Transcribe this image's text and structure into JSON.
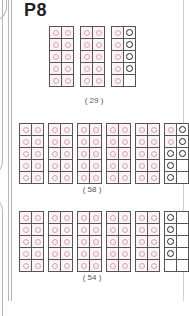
{
  "page": {
    "label": "P8"
  },
  "colors": {
    "pink_dot": "#d9a2b6",
    "pink_fill": "#fbf3f6",
    "black_dot": "#222222",
    "grid_border": "#555555"
  },
  "problems": [
    {
      "answer": "( 29 )",
      "value": 29,
      "blocks": [
        {
          "left": [
            "pink",
            "pink",
            "pink",
            "pink",
            "pink"
          ],
          "right": [
            "pink",
            "pink",
            "pink",
            "pink",
            "pink"
          ]
        },
        {
          "left": [
            "pink",
            "pink",
            "pink",
            "pink",
            "pink"
          ],
          "right": [
            "pink",
            "pink",
            "pink",
            "pink",
            "pink"
          ]
        },
        {
          "left": [
            "pink",
            "pink",
            "pink",
            "pink",
            "pink"
          ],
          "right": [
            "black",
            "black",
            "black",
            "black",
            "empty"
          ]
        }
      ]
    },
    {
      "answer": "( 58 )",
      "value": 58,
      "blocks": [
        {
          "left": [
            "pink",
            "pink",
            "pink",
            "pink",
            "pink"
          ],
          "right": [
            "pink",
            "pink",
            "pink",
            "pink",
            "pink"
          ]
        },
        {
          "left": [
            "pink",
            "pink",
            "pink",
            "pink",
            "pink"
          ],
          "right": [
            "pink",
            "pink",
            "pink",
            "pink",
            "pink"
          ]
        },
        {
          "left": [
            "pink",
            "pink",
            "pink",
            "pink",
            "pink"
          ],
          "right": [
            "pink",
            "pink",
            "pink",
            "pink",
            "pink"
          ]
        },
        {
          "left": [
            "pink",
            "pink",
            "pink",
            "pink",
            "pink"
          ],
          "right": [
            "pink",
            "pink",
            "pink",
            "pink",
            "pink"
          ]
        },
        {
          "left": [
            "pink",
            "pink",
            "pink",
            "pink",
            "pink"
          ],
          "right": [
            "pink",
            "pink",
            "pink",
            "pink",
            "pink"
          ]
        },
        {
          "left": [
            "pink",
            "pink",
            "black",
            "black",
            "black"
          ],
          "right": [
            "black",
            "black",
            "black",
            "empty",
            "empty"
          ]
        }
      ]
    },
    {
      "answer": "( 54 )",
      "value": 54,
      "blocks": [
        {
          "left": [
            "pink",
            "pink",
            "pink",
            "pink",
            "pink"
          ],
          "right": [
            "pink",
            "pink",
            "pink",
            "pink",
            "pink"
          ]
        },
        {
          "left": [
            "pink",
            "pink",
            "pink",
            "pink",
            "pink"
          ],
          "right": [
            "pink",
            "pink",
            "pink",
            "pink",
            "pink"
          ]
        },
        {
          "left": [
            "pink",
            "pink",
            "pink",
            "pink",
            "pink"
          ],
          "right": [
            "pink",
            "pink",
            "pink",
            "pink",
            "pink"
          ]
        },
        {
          "left": [
            "pink",
            "pink",
            "pink",
            "pink",
            "pink"
          ],
          "right": [
            "pink",
            "pink",
            "pink",
            "pink",
            "pink"
          ]
        },
        {
          "left": [
            "pink",
            "pink",
            "pink",
            "pink",
            "pink"
          ],
          "right": [
            "pink",
            "pink",
            "pink",
            "pink",
            "pink"
          ]
        },
        {
          "left": [
            "black",
            "black",
            "black",
            "black",
            "empty"
          ],
          "right": [
            "empty",
            "empty",
            "empty",
            "empty",
            "empty"
          ]
        }
      ]
    }
  ]
}
